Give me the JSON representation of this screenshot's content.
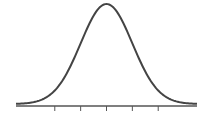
{
  "chart_data": {
    "type": "line",
    "title": "",
    "xlabel": "",
    "ylabel": "",
    "distribution": "normal",
    "mean": 0,
    "sd": 1,
    "xlim": [
      -3.5,
      3.5
    ],
    "ylim": [
      0,
      0.4
    ],
    "x_ticks": [
      -2,
      -1,
      0,
      1,
      2
    ],
    "x_tick_labels": [
      "",
      "",
      "",
      "",
      ""
    ],
    "grid": false,
    "legend": null,
    "series": [
      {
        "name": "density",
        "x": [
          -3.5,
          -3,
          -2.5,
          -2,
          -1.5,
          -1,
          -0.5,
          0,
          0.5,
          1,
          1.5,
          2,
          2.5,
          3,
          3.5
        ],
        "values": [
          0.0009,
          0.0044,
          0.0175,
          0.054,
          0.1295,
          0.242,
          0.3521,
          0.3989,
          0.3521,
          0.242,
          0.1295,
          0.054,
          0.0175,
          0.0044,
          0.0009
        ]
      }
    ],
    "colors": {
      "curve": "#444444",
      "axis": "#555555"
    }
  }
}
